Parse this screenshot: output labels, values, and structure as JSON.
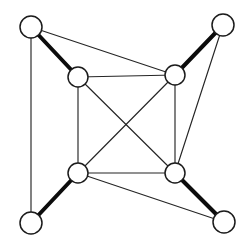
{
  "figure": {
    "type": "node-link-diagram",
    "background_color": "#ffffff",
    "width": 252,
    "height": 243
  },
  "style": {
    "node_fill": "#ffffff",
    "node_stroke": "#1b1b1b",
    "node_stroke_width": 1.5,
    "edge_thin_color": "#252525",
    "edge_thin_width": 1.15,
    "edge_thick_color": "#0c0c0c",
    "edge_thick_width": 4.0
  },
  "graph_data": {
    "node_count": 8,
    "edge_count": 13,
    "nodes": [
      {
        "id": "outer-top-left",
        "label": "",
        "x": 31,
        "y": 27,
        "r": 11,
        "group": "outer"
      },
      {
        "id": "outer-top-right",
        "label": "",
        "x": 223,
        "y": 25,
        "r": 11,
        "group": "outer"
      },
      {
        "id": "outer-bottom-left",
        "label": "",
        "x": 31,
        "y": 223,
        "r": 11,
        "group": "outer"
      },
      {
        "id": "outer-bottom-right",
        "label": "",
        "x": 224,
        "y": 222,
        "r": 11,
        "group": "outer"
      },
      {
        "id": "inner-top-left",
        "label": "",
        "x": 78,
        "y": 77,
        "r": 10,
        "group": "inner"
      },
      {
        "id": "inner-top-right",
        "label": "",
        "x": 175,
        "y": 75,
        "r": 10,
        "group": "inner"
      },
      {
        "id": "inner-bottom-left",
        "label": "",
        "x": 78,
        "y": 173,
        "r": 10,
        "group": "inner"
      },
      {
        "id": "inner-bottom-right",
        "label": "",
        "x": 175,
        "y": 173,
        "r": 10,
        "group": "inner"
      }
    ],
    "edges": [
      {
        "id": "e-otl-itl",
        "source": "outer-top-left",
        "target": "inner-top-left",
        "weight": "thick"
      },
      {
        "id": "e-otr-itr",
        "source": "outer-top-right",
        "target": "inner-top-right",
        "weight": "thick"
      },
      {
        "id": "e-obl-ibl",
        "source": "outer-bottom-left",
        "target": "inner-bottom-left",
        "weight": "thick"
      },
      {
        "id": "e-obr-ibr",
        "source": "outer-bottom-right",
        "target": "inner-bottom-right",
        "weight": "thick"
      },
      {
        "id": "e-otl-obl",
        "source": "outer-top-left",
        "target": "outer-bottom-left",
        "weight": "thin"
      },
      {
        "id": "e-otl-itr",
        "source": "outer-top-left",
        "target": "inner-top-right",
        "weight": "thin"
      },
      {
        "id": "e-otr-ibr",
        "source": "outer-top-right",
        "target": "inner-bottom-right",
        "weight": "thin"
      },
      {
        "id": "e-obr-ibl",
        "source": "outer-bottom-right",
        "target": "inner-bottom-left",
        "weight": "thin"
      },
      {
        "id": "e-itl-itr",
        "source": "inner-top-left",
        "target": "inner-top-right",
        "weight": "thin"
      },
      {
        "id": "e-itl-ibl",
        "source": "inner-top-left",
        "target": "inner-bottom-left",
        "weight": "thin"
      },
      {
        "id": "e-itr-ibr",
        "source": "inner-top-right",
        "target": "inner-bottom-right",
        "weight": "thin"
      },
      {
        "id": "e-ibl-ibr",
        "source": "inner-bottom-left",
        "target": "inner-bottom-right",
        "weight": "thin"
      },
      {
        "id": "e-itl-ibr",
        "source": "inner-top-left",
        "target": "inner-bottom-right",
        "weight": "thin"
      },
      {
        "id": "e-itr-ibl",
        "source": "inner-top-right",
        "target": "inner-bottom-left",
        "weight": "thin"
      }
    ]
  }
}
